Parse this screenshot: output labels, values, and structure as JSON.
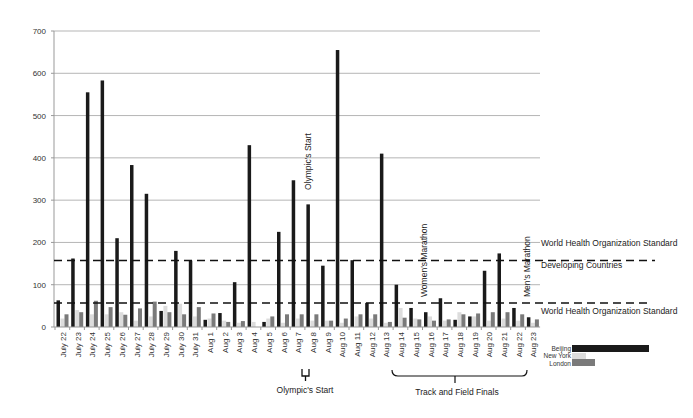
{
  "chart_data": {
    "type": "bar",
    "title": "",
    "xlabel": "",
    "ylabel": "",
    "ylim": [
      0,
      700
    ],
    "yticks": [
      0,
      100,
      200,
      300,
      400,
      500,
      600,
      700
    ],
    "grid": true,
    "legend_position": "bottom-right",
    "categories": [
      "July 22",
      "July 23",
      "July 24",
      "July 25",
      "July 26",
      "July 27",
      "July 28",
      "July 29",
      "July 30",
      "July 31",
      "Aug 1",
      "Aug 2",
      "Aug 3",
      "Aug 4",
      "Aug 5",
      "Aug 6",
      "Aug 7",
      "Aug 8",
      "Aug 9",
      "Aug 10",
      "Aug 11",
      "Aug 12",
      "Aug 13",
      "Aug 14",
      "Aug 15",
      "Aug 16",
      "Aug 17",
      "Aug 18",
      "Aug 19",
      "Aug 20",
      "Aug 21",
      "Aug 22",
      "Aug 23"
    ],
    "series": [
      {
        "name": "Beijing",
        "color": "#1a1a1a",
        "values": [
          63,
          162,
          555,
          583,
          210,
          383,
          315,
          38,
          180,
          157,
          17,
          33,
          106,
          430,
          12,
          225,
          347,
          290,
          145,
          655,
          158,
          57,
          410,
          100,
          45,
          35,
          68,
          17,
          25,
          133,
          174,
          45,
          23
        ]
      },
      {
        "name": "New York",
        "color": "#dcdcdc",
        "values": [
          20,
          40,
          30,
          30,
          35,
          15,
          25,
          50,
          55,
          25,
          20,
          15,
          10,
          12,
          20,
          10,
          20,
          15,
          15,
          10,
          25,
          20,
          10,
          45,
          20,
          25,
          15,
          35,
          25,
          15,
          20,
          15,
          10
        ]
      },
      {
        "name": "London",
        "color": "#7a7a7a",
        "values": [
          30,
          35,
          62,
          47,
          29,
          44,
          60,
          35,
          30,
          47,
          32,
          12,
          14,
          0,
          25,
          30,
          30,
          30,
          15,
          20,
          30,
          30,
          12,
          22,
          18,
          15,
          18,
          30,
          32,
          35,
          35,
          30,
          18
        ]
      }
    ],
    "reference_lines": [
      {
        "value": 157,
        "style": "dashed",
        "label": "World Health Organization Standard",
        "sublabel": "Developing Countries"
      },
      {
        "value": 57,
        "style": "dashed",
        "label": "World Health Organization Standard"
      }
    ],
    "annotations": [
      {
        "text": "Olympic's Start",
        "at": "Aug 8",
        "orientation": "vertical"
      },
      {
        "text": "Women's Marathon",
        "at": "Aug 17",
        "orientation": "vertical"
      },
      {
        "text": "Men's Marathon",
        "at": "Aug 24",
        "orientation": "vertical"
      }
    ],
    "brackets": [
      {
        "text": "Olympic's Start",
        "from": "Aug 8",
        "to": "Aug 8"
      },
      {
        "text": "Track and Field Finals",
        "from": "Aug 14",
        "to": "Aug 23"
      }
    ]
  },
  "labels": {
    "who_standard_top": "World Health Organization Standard",
    "who_developing": "Developing Countries",
    "who_standard_bottom": "World Health Organization Standard",
    "olympic_start_vertical": "Olympic's Start",
    "womens_marathon": "Women's Marathon",
    "mens_marathon": "Men's Marathon",
    "olympic_start_bracket": "Olympic's Start",
    "track_field_bracket": "Track and Field Finals",
    "legend_beijing": "Beijing",
    "legend_newyork": "New York",
    "legend_london": "London"
  }
}
